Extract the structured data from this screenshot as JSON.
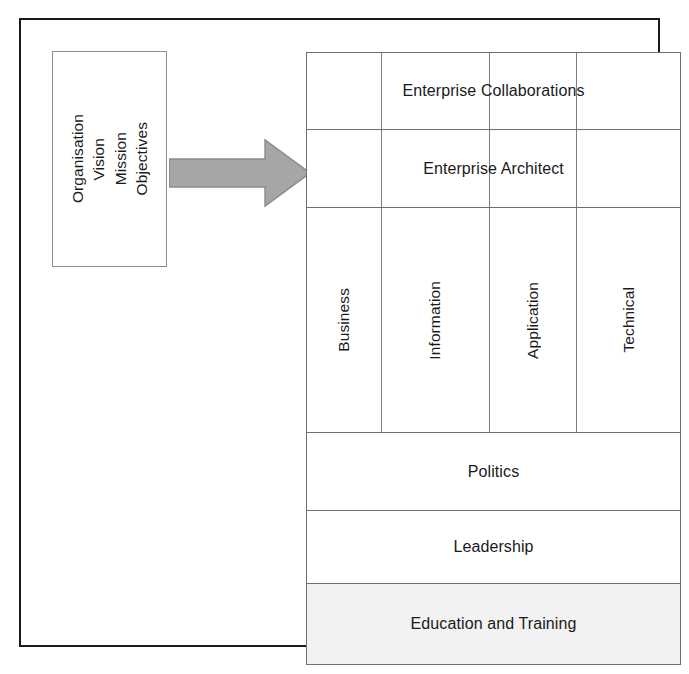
{
  "figure": {
    "frame_color": "#1a1a1a",
    "grid_line_color": "#6f6f6f",
    "shade_color": "#f2f2f2",
    "arrow_fill": "#a6a6a6",
    "arrow_stroke": "#808080"
  },
  "drivers_box": {
    "name": "organisation-drivers",
    "lines": [
      "Organisation",
      "Vision",
      "Mission",
      "Objectives"
    ]
  },
  "arrow": {
    "name": "flow-arrow",
    "direction": "right"
  },
  "framework": {
    "top_bands": [
      {
        "label": "Enterprise Collaborations",
        "shaded": false
      },
      {
        "label": "Enterprise Architect",
        "shaded": false
      }
    ],
    "pillars": [
      {
        "label": "Business"
      },
      {
        "label": "Information"
      },
      {
        "label": "Application"
      },
      {
        "label": "Technical"
      }
    ],
    "bottom_bands": [
      {
        "label": "Politics",
        "shaded": false
      },
      {
        "label": "Leadership",
        "shaded": false
      },
      {
        "label": "Education and Training",
        "shaded": true
      }
    ]
  }
}
